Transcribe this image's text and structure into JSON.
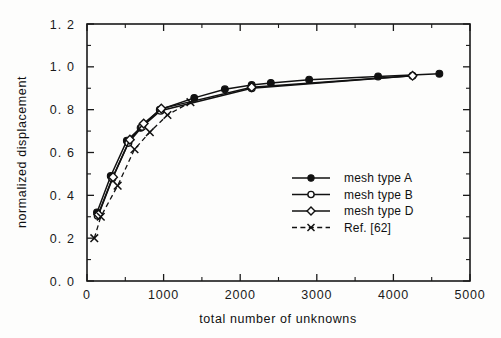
{
  "chart_data": {
    "type": "line",
    "title": "",
    "xlabel": "total number of unknowns",
    "ylabel": "normalized displacement",
    "xlim": [
      0,
      5000
    ],
    "ylim": [
      0.0,
      1.2
    ],
    "xticks": [
      0,
      1000,
      2000,
      3000,
      4000,
      5000
    ],
    "xticklabels": [
      "0",
      "1000",
      "2000",
      "3000",
      "4000",
      "5000"
    ],
    "yticks": [
      0.0,
      0.2,
      0.4,
      0.6,
      0.8,
      1.0,
      1.2
    ],
    "yticklabels": [
      "0. 0",
      "0. 2",
      "0. 4",
      "0. 6",
      "0. 8",
      "1. 0",
      "1. 2"
    ],
    "grid": false,
    "minor_ticks": true,
    "legend_position": "lower right",
    "series": [
      {
        "name": "mesh type A",
        "marker": "filled-circle",
        "linestyle": "solid",
        "color": "#111111",
        "x": [
          130,
          310,
          520,
          700,
          950,
          1400,
          1800,
          2150,
          2400,
          2900,
          3800,
          4600
        ],
        "y": [
          0.32,
          0.49,
          0.655,
          0.715,
          0.8,
          0.855,
          0.895,
          0.915,
          0.925,
          0.94,
          0.955,
          0.968
        ]
      },
      {
        "name": "mesh type B",
        "marker": "open-circle",
        "linestyle": "solid",
        "color": "#111111",
        "x": [
          140,
          330,
          540,
          720,
          960,
          2150,
          4250
        ],
        "y": [
          0.305,
          0.48,
          0.645,
          0.72,
          0.795,
          0.9,
          0.958
        ]
      },
      {
        "name": "mesh type D",
        "marker": "open-diamond",
        "linestyle": "solid",
        "color": "#111111",
        "x": [
          150,
          340,
          560,
          740,
          970,
          2150,
          4250
        ],
        "y": [
          0.31,
          0.485,
          0.66,
          0.735,
          0.805,
          0.905,
          0.958
        ]
      },
      {
        "name": "Ref. [62]",
        "marker": "cross-x",
        "linestyle": "dashed",
        "color": "#111111",
        "x": [
          95,
          180,
          400,
          620,
          820,
          1050,
          1350
        ],
        "y": [
          0.2,
          0.3,
          0.445,
          0.615,
          0.695,
          0.775,
          0.835
        ]
      }
    ]
  },
  "legend": {
    "entries": [
      {
        "label": "mesh type A",
        "marker": "filled-circle",
        "linestyle": "solid"
      },
      {
        "label": "mesh type B",
        "marker": "open-circle",
        "linestyle": "solid"
      },
      {
        "label": "mesh type D",
        "marker": "open-diamond",
        "linestyle": "solid"
      },
      {
        "label": "Ref. [62]",
        "marker": "cross-x",
        "linestyle": "dashed"
      }
    ]
  },
  "colors": {
    "ink": "#111111",
    "paper": "#fdfdfc"
  }
}
